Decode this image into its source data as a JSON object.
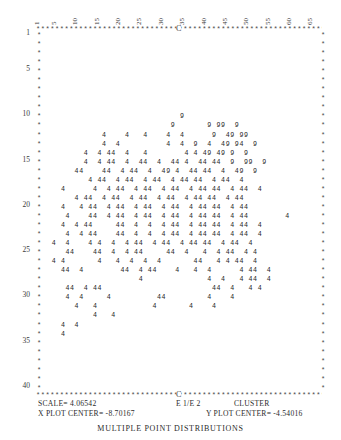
{
  "title": "MULTIPLE POINT DISTRIBUTIONS",
  "axes": {
    "x_ticks": [
      "1",
      "5",
      "10",
      "15",
      "20",
      "25",
      "30",
      "35",
      "40",
      "45",
      "50",
      "55",
      "60",
      "65"
    ],
    "y_ticks": [
      "1",
      "5",
      "10",
      "15",
      "20",
      "25",
      "30",
      "35",
      "40"
    ],
    "center_marker": "C",
    "border_char": "*"
  },
  "footer": {
    "scale_label": "SCALE=",
    "scale_value": "4.06542",
    "series_label": "E 1/E 2",
    "cluster_label": "CLUSTER",
    "x_center_label": "X PLOT CENTER=",
    "x_center_value": "-8.70167",
    "y_center_label": "Y PLOT CENTER=",
    "y_center_value": "-4.54016"
  },
  "chart_data": {
    "type": "scatter",
    "title": "MULTIPLE POINT DISTRIBUTIONS",
    "xlabel": "",
    "ylabel": "",
    "xlim": [
      1,
      66
    ],
    "ylim": [
      1,
      41
    ],
    "grid": false,
    "legend": "none",
    "symbols": [
      "4",
      "9"
    ],
    "series": [
      {
        "name": "cluster 4",
        "symbol": "4"
      },
      {
        "name": "cluster 9",
        "symbol": "9"
      }
    ],
    "rows": [
      {
        "y": 1,
        "text": ""
      },
      {
        "y": 2,
        "text": ""
      },
      {
        "y": 3,
        "text": ""
      },
      {
        "y": 4,
        "text": ""
      },
      {
        "y": 5,
        "text": ""
      },
      {
        "y": 6,
        "text": ""
      },
      {
        "y": 7,
        "text": ""
      },
      {
        "y": 8,
        "text": ""
      },
      {
        "y": 9,
        "text": ""
      },
      {
        "y": 10,
        "text": "                               9"
      },
      {
        "y": 11,
        "text": "                             9       9 99  9"
      },
      {
        "y": 12,
        "text": "              4    4   4    4  4      9  49 99"
      },
      {
        "y": 13,
        "text": "              4  4          4  4  9  4  49 94  9"
      },
      {
        "y": 14,
        "text": "          4  4 44  4   4        4 4 49 49 9  9"
      },
      {
        "y": 15,
        "text": "          4  4 44  4  44  4  44 4  44 44  9  99  9"
      },
      {
        "y": 16,
        "text": "        44    44  4 44  4  49 4  44 44  4  49  9"
      },
      {
        "y": 17,
        "text": "           4 44  4 44  4 44  4 44 44  4 44  4"
      },
      {
        "y": 18,
        "text": "     4      4  4 44  4 44  4 44  4 44 44  4 44  4"
      },
      {
        "y": 19,
        "text": "        4 44  4 44  4 44  4 44  4 44 44  4 44"
      },
      {
        "y": 20,
        "text": "     4   4 44  4 44  4 44  4 44  4 44 44  4 44"
      },
      {
        "y": 21,
        "text": "      4    44  4 44  4 44  4 44  4 44 44  4 44        4"
      },
      {
        "y": 22,
        "text": "     4  4 44     44  4  4  4 44  4 44 44  4 44  4"
      },
      {
        "y": 23,
        "text": "      4  4 44    44  4  4  4 44  4 44 44  4 44  4"
      },
      {
        "y": 24,
        "text": "   4  4    4 4  4  4 44  4 44  4 44 44  4 44  4"
      },
      {
        "y": 25,
        "text": "      44    44  4  4 44     44  4   4  4 44  4 4"
      },
      {
        "y": 26,
        "text": "   4 4       4   4  4  4  4       44   4 4 44  4"
      },
      {
        "y": 27,
        "text": "     44  4        44  4 44    4   4  4      4 44  4"
      },
      {
        "y": 28,
        "text": "                      4              4  4   4 44  4"
      },
      {
        "y": 29,
        "text": "      44  4 44                        44  4   4 4"
      },
      {
        "y": 30,
        "text": "      4  4     4          44         4    4"
      },
      {
        "y": 31,
        "text": "        4   4            4       4    4"
      },
      {
        "y": 32,
        "text": "            4   4"
      },
      {
        "y": 33,
        "text": "     4  4"
      },
      {
        "y": 34,
        "text": "     4"
      },
      {
        "y": 35,
        "text": ""
      },
      {
        "y": 36,
        "text": ""
      },
      {
        "y": 37,
        "text": ""
      },
      {
        "y": 38,
        "text": ""
      },
      {
        "y": 39,
        "text": ""
      },
      {
        "y": 40,
        "text": ""
      }
    ]
  }
}
